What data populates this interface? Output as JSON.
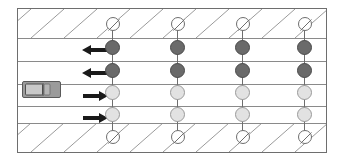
{
  "diagram": {
    "canvas": {
      "width": 344,
      "height": 162,
      "background": "#ffffff"
    },
    "road": {
      "x": 17,
      "y": 8,
      "width": 310,
      "height": 145,
      "border_color": "#6e6e6e",
      "fill": "#ffffff"
    },
    "shoulders": [
      {
        "name": "top-shoulder",
        "y": 0,
        "height": 29,
        "hatch": "diagonal-up-right",
        "hatch_color": "#9a9a9a",
        "hatch_spacing": 33
      },
      {
        "name": "bottom-shoulder",
        "y": 114,
        "height": 29,
        "hatch": "diagonal-up-right",
        "hatch_color": "#9a9a9a",
        "hatch_spacing": 33
      }
    ],
    "lane_lines_y": [
      29,
      52,
      75,
      97,
      114
    ],
    "lanes": [
      {
        "id": "lane-1",
        "label": "westbound-outer",
        "direction": "left",
        "arrow_y": 35,
        "node_color": "#6a6a6a",
        "node_state": "dark"
      },
      {
        "id": "lane-2",
        "label": "westbound-inner",
        "direction": "left",
        "arrow_y": 58,
        "node_color": "#6a6a6a",
        "node_state": "dark"
      },
      {
        "id": "lane-3",
        "label": "eastbound-inner",
        "direction": "right",
        "arrow_y": 81,
        "node_color": "#e2e2e2",
        "node_state": "light"
      },
      {
        "id": "lane-4",
        "label": "eastbound-outer",
        "direction": "right",
        "arrow_y": 103,
        "node_color": "#e2e2e2",
        "node_state": "light"
      }
    ],
    "arrow_x": 64,
    "post_columns_x": [
      94,
      159,
      224,
      286
    ],
    "node_rows_y": [
      15,
      38,
      61,
      84,
      106,
      129
    ],
    "node_states": [
      "slashed",
      "dark",
      "dark",
      "light",
      "light",
      "slashed"
    ],
    "vehicle": {
      "name": "car",
      "x": 21,
      "y": 80,
      "width": 39,
      "height": 17,
      "body_color": "#9b9b9b",
      "cabin_color": "#c9c9c9",
      "outline_color": "#5a5a5a",
      "heading": "right",
      "in_lane": "lane-3"
    },
    "colors": {
      "dark_node": "#6a6a6a",
      "light_node": "#e2e2e2",
      "slashed_node": "#ffffff",
      "line": "#6e6e6e",
      "lane_divider": "#8a8a8a",
      "hatch": "#9a9a9a",
      "arrow": "#1a1a1a"
    }
  }
}
